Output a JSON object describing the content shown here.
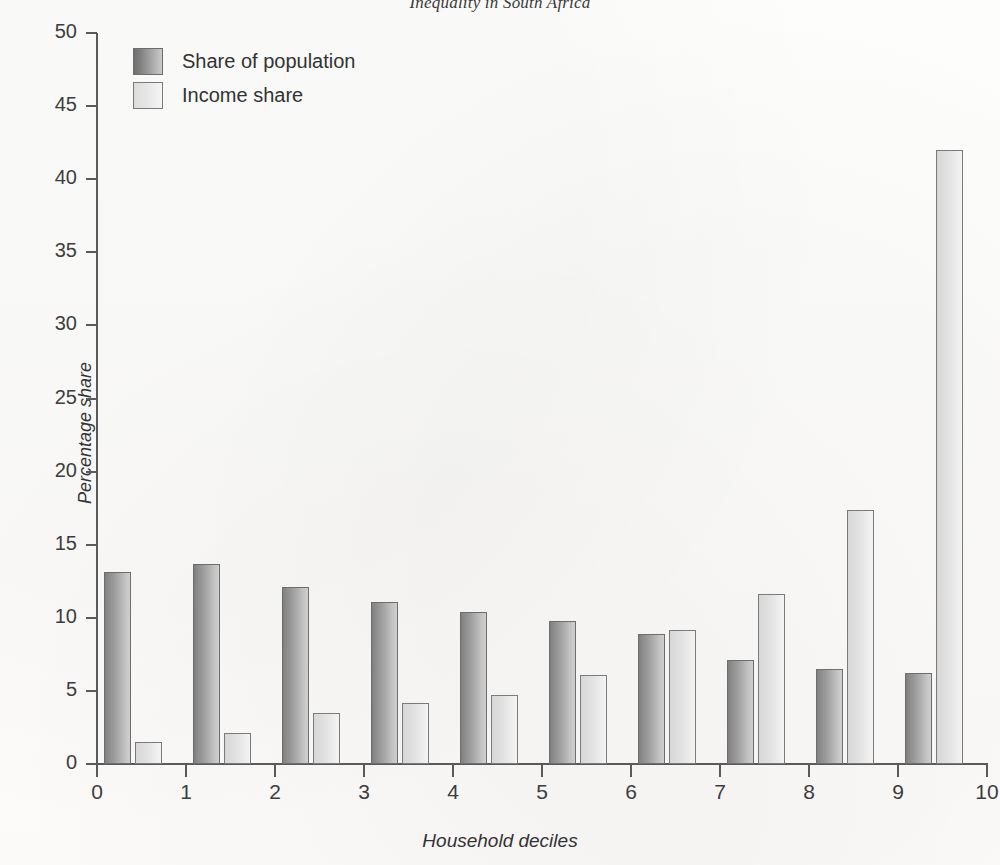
{
  "chart_data": {
    "type": "bar",
    "title": "Inequality in South Africa",
    "xlabel": "Household deciles",
    "ylabel": "Percentage share",
    "categories": [
      "0",
      "1",
      "2",
      "3",
      "4",
      "5",
      "6",
      "7",
      "8",
      "9"
    ],
    "series": [
      {
        "name": "Share of population",
        "color": "#9a9a9a",
        "values": [
          13.1,
          13.7,
          12.1,
          11.1,
          10.4,
          9.8,
          8.9,
          7.1,
          6.5,
          6.2
        ]
      },
      {
        "name": "Income share",
        "color": "#e6e6e6",
        "values": [
          1.5,
          2.1,
          3.5,
          4.2,
          4.7,
          6.1,
          9.2,
          11.6,
          17.4,
          42.0
        ]
      }
    ],
    "ylim": [
      0,
      50
    ],
    "ytick_values": [
      0,
      5,
      10,
      15,
      20,
      25,
      30,
      35,
      40,
      45,
      50
    ],
    "xlim": [
      0,
      10
    ],
    "xtick_values": [
      0,
      1,
      2,
      3,
      4,
      5,
      6,
      7,
      8,
      9,
      10
    ],
    "xtick_labels": [
      "0",
      "1",
      "2",
      "3",
      "4",
      "5",
      "6",
      "7",
      "8",
      "9",
      "10"
    ],
    "grid": false,
    "legend_position": "top-left"
  }
}
